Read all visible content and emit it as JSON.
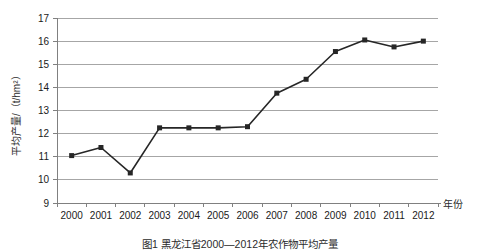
{
  "figure": {
    "caption": "图1  黑龙江省2000—2012年农作物平均产量"
  },
  "axes": {
    "y_title": "平均产量/（t/hm²）",
    "x_title": "年份",
    "y_ticks": [
      "9",
      "10",
      "11",
      "12",
      "13",
      "14",
      "15",
      "16",
      "17"
    ],
    "x_ticks": [
      "2000",
      "2001",
      "2002",
      "2003",
      "2004",
      "2005",
      "2006",
      "2007",
      "2008",
      "2009",
      "2010",
      "2011",
      "2012"
    ]
  },
  "style": {
    "series_color": "#262626",
    "grid_color": "#a6a6a6",
    "axis_color": "#808080",
    "background": "#ffffff"
  },
  "chart_data": {
    "type": "line",
    "title": "",
    "xlabel": "年份",
    "ylabel": "平均产量/（t/hm²）",
    "categories": [
      2000,
      2001,
      2002,
      2003,
      2004,
      2005,
      2006,
      2007,
      2008,
      2009,
      2010,
      2011,
      2012
    ],
    "values": [
      11.05,
      11.4,
      10.3,
      12.25,
      12.25,
      12.25,
      12.3,
      13.75,
      14.35,
      15.55,
      16.05,
      15.75,
      16.0
    ],
    "ylim": [
      9,
      17
    ],
    "ytick_step": 1,
    "grid": true,
    "grid_axis": "y",
    "legend": false,
    "marker": "square"
  }
}
